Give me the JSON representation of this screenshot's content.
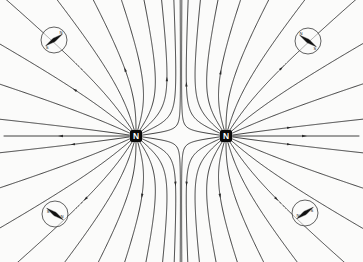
{
  "figure": {
    "background_color": "#fbfbfa",
    "line_color": "#2a2a2a",
    "width": 363,
    "height": 262
  },
  "poles": [
    {
      "id": "pole-left",
      "label": "N",
      "polarity": "north",
      "x": 136,
      "y": 136,
      "box_size": 11
    },
    {
      "id": "pole-right",
      "label": "N",
      "polarity": "north",
      "x": 226,
      "y": 136,
      "box_size": 11
    }
  ],
  "compasses": [
    {
      "id": "compass-top-left",
      "x": 54,
      "y": 40,
      "r": 13,
      "needle_angle_deg": -35,
      "north_label": "N",
      "south_label": "S"
    },
    {
      "id": "compass-top-right",
      "x": 308,
      "y": 41,
      "r": 13,
      "needle_angle_deg": -145,
      "north_label": "N",
      "south_label": "S"
    },
    {
      "id": "compass-bottom-left",
      "x": 55,
      "y": 214,
      "r": 13,
      "needle_angle_deg": 35,
      "north_label": "N",
      "south_label": "S"
    },
    {
      "id": "compass-bottom-right",
      "x": 305,
      "y": 213,
      "r": 13,
      "needle_angle_deg": 145,
      "north_label": "N",
      "south_label": "S"
    }
  ],
  "chart_data": {
    "type": "line",
    "xlabel": "",
    "ylabel": "",
    "xlim": [
      0,
      363
    ],
    "ylim": [
      0,
      262
    ],
    "grid": false,
    "legend": "none",
    "annotations": [
      {
        "text": "N",
        "x": 136,
        "y": 136,
        "kind": "pole-marker"
      },
      {
        "text": "N",
        "x": 226,
        "y": 136,
        "kind": "pole-marker"
      },
      {
        "text": "N",
        "x": 54,
        "y": 40,
        "kind": "compass-needle-north"
      },
      {
        "text": "S",
        "x": 54,
        "y": 40,
        "kind": "compass-needle-south"
      },
      {
        "text": "N",
        "x": 308,
        "y": 41,
        "kind": "compass-needle-north"
      },
      {
        "text": "S",
        "x": 308,
        "y": 41,
        "kind": "compass-needle-south"
      },
      {
        "text": "N",
        "x": 55,
        "y": 214,
        "kind": "compass-needle-north"
      },
      {
        "text": "S",
        "x": 55,
        "y": 214,
        "kind": "compass-needle-south"
      },
      {
        "text": "N",
        "x": 305,
        "y": 213,
        "kind": "compass-needle-north"
      },
      {
        "text": "S",
        "x": 305,
        "y": 213,
        "kind": "compass-needle-south"
      }
    ],
    "sources": [
      {
        "x": 136,
        "y": 136,
        "strength": 1,
        "label": "N"
      },
      {
        "x": 226,
        "y": 136,
        "strength": 1,
        "label": "N"
      }
    ],
    "lines_per_pole": 22,
    "field_direction": "outward from both poles"
  }
}
